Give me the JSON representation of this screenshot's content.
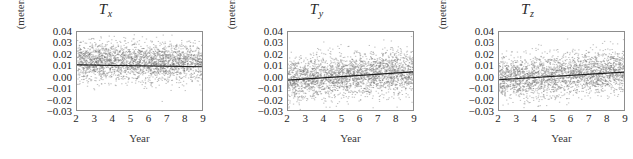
{
  "figure": {
    "width": 633,
    "height": 159,
    "background": "#ffffff",
    "panel_count": 3
  },
  "chart_data": [
    {
      "type": "scatter",
      "title": "T",
      "title_subscript": "x",
      "xlabel": "Year",
      "ylabel": "(meters)",
      "xlim": [
        2,
        9
      ],
      "ylim": [
        -0.03,
        0.04
      ],
      "xticks": [
        2,
        3,
        4,
        5,
        6,
        7,
        8,
        9
      ],
      "xticklabels": [
        "2",
        "3",
        "4",
        "5",
        "6",
        "7",
        "8",
        "9"
      ],
      "yticks": [
        0.04,
        0.03,
        0.02,
        0.01,
        0.0,
        -0.01,
        -0.02,
        -0.03
      ],
      "yticklabels": [
        "0.04",
        "0.03",
        "0.02",
        "0.01",
        "0.00",
        "−0.01",
        "−0.02",
        "−0.03"
      ],
      "grid": false,
      "frame": true,
      "marker_color": "#6f6f6f",
      "marker_size": 0.6,
      "point_count": 2600,
      "scatter_center": 0.007,
      "scatter_sigma": 0.0085,
      "trend_color": "#1c1c1c",
      "trend_start_y": 0.0105,
      "trend_end_y": 0.0088,
      "trend_note": "nearly flat horizontal fit line near 0.01"
    },
    {
      "type": "scatter",
      "title": "T",
      "title_subscript": "y",
      "xlabel": "Year",
      "ylabel": "(meters)",
      "xlim": [
        2,
        9
      ],
      "ylim": [
        -0.03,
        0.04
      ],
      "xticks": [
        2,
        3,
        4,
        5,
        6,
        7,
        8,
        9
      ],
      "xticklabels": [
        "2",
        "3",
        "4",
        "5",
        "6",
        "7",
        "8",
        "9"
      ],
      "yticks": [
        0.04,
        0.03,
        0.02,
        0.01,
        0.0,
        -0.01,
        -0.02,
        -0.03
      ],
      "yticklabels": [
        "0.04",
        "0.03",
        "0.02",
        "0.01",
        "0.00",
        "−0.01",
        "−0.02",
        "−0.03"
      ],
      "grid": false,
      "frame": true,
      "marker_color": "#6f6f6f",
      "marker_size": 0.6,
      "point_count": 2600,
      "scatter_center": 0.0015,
      "scatter_sigma": 0.0095,
      "trend_color": "#1c1c1c",
      "trend_start_y": -0.0032,
      "trend_end_y": 0.0042,
      "trend_note": "rising fit line from about -0.003 to +0.004"
    },
    {
      "type": "scatter",
      "title": "T",
      "title_subscript": "z",
      "xlabel": "Year",
      "ylabel": "(meters)",
      "xlim": [
        2,
        9
      ],
      "ylim": [
        -0.03,
        0.04
      ],
      "xticks": [
        2,
        3,
        4,
        5,
        6,
        7,
        8,
        9
      ],
      "xticklabels": [
        "2",
        "3",
        "4",
        "5",
        "6",
        "7",
        "8",
        "9"
      ],
      "yticks": [
        0.04,
        0.03,
        0.02,
        0.01,
        0.0,
        -0.01,
        -0.02,
        -0.03
      ],
      "yticklabels": [
        "0.04",
        "0.03",
        "0.02",
        "0.01",
        "0.00",
        "−0.01",
        "−0.02",
        "−0.03"
      ],
      "grid": false,
      "frame": true,
      "marker_color": "#6f6f6f",
      "marker_size": 0.6,
      "point_count": 2600,
      "scatter_center": 0.0022,
      "scatter_sigma": 0.0092,
      "trend_color": "#1c1c1c",
      "trend_start_y": -0.0028,
      "trend_end_y": 0.004,
      "trend_note": "rising fit line from about -0.003 to +0.004"
    }
  ]
}
